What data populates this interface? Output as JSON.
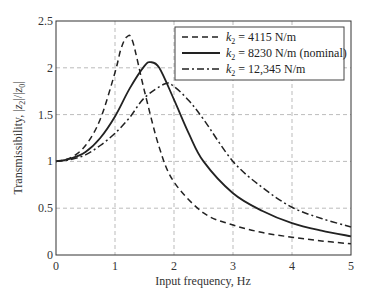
{
  "chart_data": {
    "type": "line",
    "title": "",
    "xlabel": "Input frequency, Hz",
    "ylabel": "Transmissibility, |z2|/|z0|",
    "xlim": [
      0,
      5
    ],
    "ylim": [
      0,
      2.5
    ],
    "xticks": [
      "0",
      "1",
      "2",
      "3",
      "4",
      "5"
    ],
    "yticks": [
      "0",
      "0.5",
      "1",
      "1.5",
      "2",
      "2.5"
    ],
    "grid": true,
    "legend_position": "upper right",
    "series": [
      {
        "name": "k2 = 4115 N/m",
        "style": "dashed",
        "x": [
          0,
          0.25,
          0.5,
          0.75,
          1.0,
          1.1,
          1.2,
          1.3,
          1.5,
          1.75,
          2.0,
          2.5,
          3.0,
          3.5,
          4.0,
          4.5,
          5.0
        ],
        "y": [
          1.0,
          1.04,
          1.17,
          1.45,
          1.95,
          2.2,
          2.33,
          2.28,
          1.75,
          1.15,
          0.78,
          0.45,
          0.32,
          0.24,
          0.19,
          0.15,
          0.12
        ]
      },
      {
        "name": "k2 = 8230 N/m (nominal)",
        "style": "solid",
        "x": [
          0,
          0.25,
          0.5,
          0.75,
          1.0,
          1.25,
          1.5,
          1.6,
          1.75,
          2.0,
          2.25,
          2.5,
          3.0,
          3.5,
          4.0,
          4.5,
          5.0
        ],
        "y": [
          1.0,
          1.03,
          1.1,
          1.25,
          1.48,
          1.78,
          2.02,
          2.06,
          2.0,
          1.66,
          1.3,
          1.0,
          0.66,
          0.47,
          0.34,
          0.26,
          0.2
        ]
      },
      {
        "name": "k2 = 12,345 N/m",
        "style": "dashdot",
        "x": [
          0,
          0.25,
          0.5,
          0.75,
          1.0,
          1.25,
          1.5,
          1.85,
          2.0,
          2.25,
          2.5,
          3.0,
          3.5,
          4.0,
          4.5,
          5.0
        ],
        "y": [
          1.0,
          1.02,
          1.07,
          1.17,
          1.3,
          1.47,
          1.68,
          1.83,
          1.8,
          1.65,
          1.45,
          1.0,
          0.72,
          0.51,
          0.39,
          0.3
        ]
      }
    ]
  },
  "legend": {
    "items": [
      {
        "prefix": "k",
        "sub": "2",
        "text": " = 4115 N/m"
      },
      {
        "prefix": "k",
        "sub": "2",
        "text": " = 8230 N/m (nominal)"
      },
      {
        "prefix": "k",
        "sub": "2",
        "text": " = 12,345 N/m"
      }
    ]
  },
  "axes": {
    "xlabel": "Input frequency, Hz",
    "ylabel_prefix": "Transmissibility, ",
    "ylabel_math": "|z2|/|z0|"
  }
}
